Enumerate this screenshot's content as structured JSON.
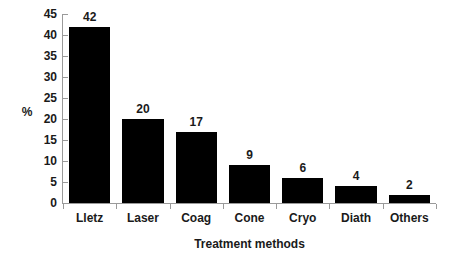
{
  "chart_data": {
    "type": "bar",
    "title": "",
    "categories": [
      "Lletz",
      "Laser",
      "Coag",
      "Cone",
      "Cryo",
      "Diath",
      "Others"
    ],
    "values": [
      42,
      20,
      17,
      9,
      6,
      4,
      2
    ],
    "data_labels": [
      "42",
      "20",
      "17",
      "9",
      "6",
      "4",
      "2"
    ],
    "xlabel": "Treatment methods",
    "ylabel": "%",
    "ylim": [
      0,
      45
    ],
    "y_ticks": [
      0,
      5,
      10,
      15,
      20,
      25,
      30,
      35,
      40,
      45
    ],
    "y_tick_labels": [
      "0",
      "5",
      "10",
      "15",
      "20",
      "25",
      "30",
      "35",
      "40",
      "45"
    ],
    "grid": false,
    "legend": false,
    "bar_color": "#000000",
    "axis_color": "#9a9a9a",
    "text_color": "#1a1a1a",
    "background": "#ffffff"
  }
}
